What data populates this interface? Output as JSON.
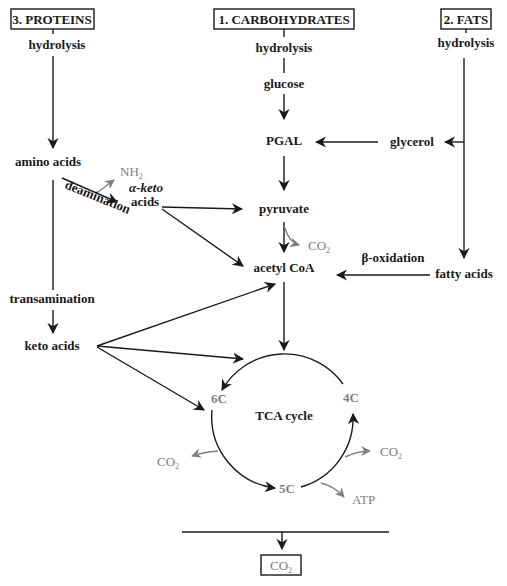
{
  "sources": {
    "proteins": "3. PROTEINS",
    "carbohydrates": "1. CARBOHYDRATES",
    "fats": "2. FATS"
  },
  "steps": {
    "hydrolysis_proteins": "hydrolysis",
    "hydrolysis_carbs": "hydrolysis",
    "hydrolysis_fats": "hydrolysis",
    "glucose": "glucose",
    "pgal": "PGAL",
    "glycerol": "glycerol",
    "amino_acids": "amino acids",
    "nh2": "NH",
    "nh2_sub": "2",
    "deamination": "deamination",
    "alpha_keto_1": "α-keto",
    "alpha_keto_2": "acids",
    "pyruvate": "pyruvate",
    "co2_pyruvate": "CO",
    "co2_sub": "2",
    "acetyl_coa": "acetyl CoA",
    "beta_oxidation": "β-oxidation",
    "fatty_acids": "fatty acids",
    "transamination": "transamination",
    "keto_acids": "keto acids",
    "tca_cycle": "TCA cycle",
    "c6": "6C",
    "c4": "4C",
    "c5": "5C",
    "co2_left": "CO",
    "co2_right": "CO",
    "atp": "ATP",
    "co2_final": "CO"
  }
}
